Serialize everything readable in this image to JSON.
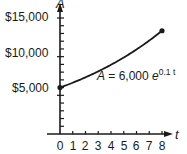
{
  "chart_data": {
    "type": "line",
    "title": "",
    "xlabel": "t",
    "ylabel": "A",
    "xlim": [
      0,
      8
    ],
    "ylim": [
      0,
      15000
    ],
    "x_ticks": [
      "0",
      "1",
      "2",
      "3",
      "4",
      "5",
      "6",
      "7",
      "8"
    ],
    "y_ticks": [
      {
        "value": 5000,
        "label": "$5,000"
      },
      {
        "value": 10000,
        "label": "$10,000"
      },
      {
        "value": 15000,
        "label": "$15,000"
      }
    ],
    "y_minor_tick_step": 1000,
    "grid": false,
    "legend": null,
    "series": [
      {
        "name": "A = 6,000 e^(0.1 t)",
        "x": [
          0,
          1,
          2,
          3,
          4,
          5,
          6,
          7,
          8
        ],
        "values": [
          6000,
          6631,
          7328,
          8099,
          8951,
          9892,
          10933,
          12083,
          13353
        ],
        "color": "#1a1a1a",
        "endpoints_marked": true
      }
    ],
    "annotations": [
      {
        "text_main": "A = 6,000 e",
        "superscript": "0.1 t",
        "x": 4.3,
        "y": 7800
      }
    ]
  },
  "labels": {
    "y_axis_name": "A",
    "x_axis_name": "t",
    "y15000": "$15,000",
    "y10000": "$10,000",
    "y5000": "$5,000",
    "x0": "0",
    "x1": "1",
    "x2": "2",
    "x3": "3",
    "x4": "4",
    "x5": "5",
    "x6": "6",
    "x7": "7",
    "x8": "8",
    "eq_A": "A",
    "eq_mid": " = 6,000 ",
    "eq_e": "e",
    "eq_sup": "0.1 t"
  },
  "colors": {
    "ink": "#1a1a1a",
    "background": "#ffffff"
  }
}
